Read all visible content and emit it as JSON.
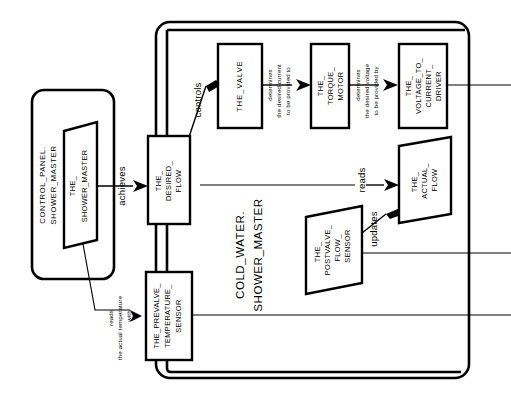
{
  "diagram": {
    "kind": "structure-diagram",
    "orientation": "rotated-90-ccw",
    "background_color": "#ffffff",
    "line_color": "#000000",
    "containers": [
      {
        "id": "control-panel",
        "title_line1": "CONTROL_PANEL.",
        "title_line2": "SHOWER_MASTER"
      },
      {
        "id": "cold-water",
        "title_line1": "COLD_WATER.",
        "title_line2": "SHOWER_MASTER"
      }
    ],
    "nodes": {
      "shower_master": {
        "l1": "THE_",
        "l2": "SHOWER_MASTER",
        "shape": "parallelogram"
      },
      "desired_flow": {
        "l1": "THE_",
        "l2": "DESIRED_",
        "l3": "FLOW",
        "shape": "rectangle"
      },
      "prevalve_sensor": {
        "l1": "THE_PREVALVE_",
        "l2": "TEMPERATURE_",
        "l3": "SENSOR",
        "shape": "rectangle"
      },
      "valve": {
        "l1": "THE_VALVE",
        "shape": "rectangle"
      },
      "torque_motor": {
        "l1": "THE_",
        "l2": "TORQUE_",
        "l3": "MOTOR",
        "shape": "rectangle"
      },
      "voltage_driver": {
        "l1": "THE_",
        "l2": "VOLTAGE_TO_",
        "l3": "CURRENT_",
        "l4": "DRIVER",
        "shape": "rectangle"
      },
      "actual_flow": {
        "l1": "THE_",
        "l2": "ACTUAL_",
        "l3": "FLOW",
        "shape": "parallelogram"
      },
      "postvalve_sensor": {
        "l1": "THE_",
        "l2": "POSTVALVE_",
        "l3": "FLOW_",
        "l4": "SENSOR",
        "shape": "parallelogram"
      }
    },
    "relations": {
      "achieves": "achieves",
      "controls": "controls",
      "reads": "reads",
      "updates": "updates",
      "reads_temp_l1": "reads",
      "reads_temp_l2": "the actual temperature",
      "reads_temp_l3": "with",
      "determines_current_l1": "determines",
      "determines_current_l2": "the desired current",
      "determines_current_l3": "to be provided to",
      "determines_voltage_l1": "determines",
      "determines_voltage_l2": "the desired voltage",
      "determines_voltage_l3": "to be provided by"
    }
  }
}
